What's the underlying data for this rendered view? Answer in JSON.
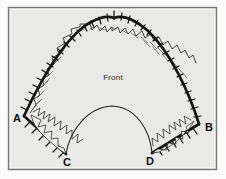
{
  "figure": {
    "background_color": "#e9e9e7",
    "page_color": "#fbfbfb",
    "frame": {
      "border_color": "#6f6f6f",
      "inner_color": "#e9e9e7",
      "x": 8,
      "y": 7,
      "width": 209,
      "height": 163
    },
    "ink_color": "#1a1a1a",
    "labels": {
      "a": "A",
      "b": "B",
      "c": "C",
      "d": "D",
      "front": "Front"
    },
    "label_positions": {
      "a": {
        "x": 13,
        "y": 122
      },
      "b": {
        "x": 205,
        "y": 131
      },
      "c": {
        "x": 63,
        "y": 165
      },
      "d": {
        "x": 147,
        "y": 164
      },
      "front": {
        "x": 100,
        "y": 80
      }
    },
    "geometry": {
      "apex": {
        "x": 114,
        "y": 19
      },
      "point_a": {
        "x": 24,
        "y": 116
      },
      "point_b": {
        "x": 199,
        "y": 124
      },
      "point_c": {
        "x": 66,
        "y": 154
      },
      "point_d": {
        "x": 152,
        "y": 153
      },
      "arch_stroke_width": 2.6,
      "tick_count": 44,
      "tick_length": 5,
      "tooth_count": 40,
      "inner_arc_peak": {
        "x": 112,
        "y": 106
      }
    }
  }
}
